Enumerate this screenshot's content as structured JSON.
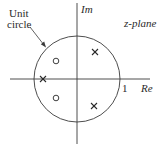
{
  "diagram": {
    "title": "z-plane",
    "axes": {
      "imag_label": "Im",
      "real_label": "Re",
      "real_tick_label": "1"
    },
    "unit_circle_label_line1": "Unit",
    "unit_circle_label_line2": "circle",
    "geometry": {
      "origin": [
        77,
        79
      ],
      "radius": 43
    },
    "poles": [
      {
        "name": "pole-upper-right",
        "x": 95,
        "y": 52
      },
      {
        "name": "pole-lower-right",
        "x": 94,
        "y": 106
      },
      {
        "name": "pole-real-axis",
        "x": 43,
        "y": 79
      }
    ],
    "zeros": [
      {
        "name": "zero-upper-left",
        "x": 56,
        "y": 61
      },
      {
        "name": "zero-lower-left",
        "x": 56,
        "y": 98
      }
    ],
    "colors": {
      "stroke": "#3a3a3a",
      "text": "#2a2a2a",
      "background": "#ffffff"
    }
  }
}
